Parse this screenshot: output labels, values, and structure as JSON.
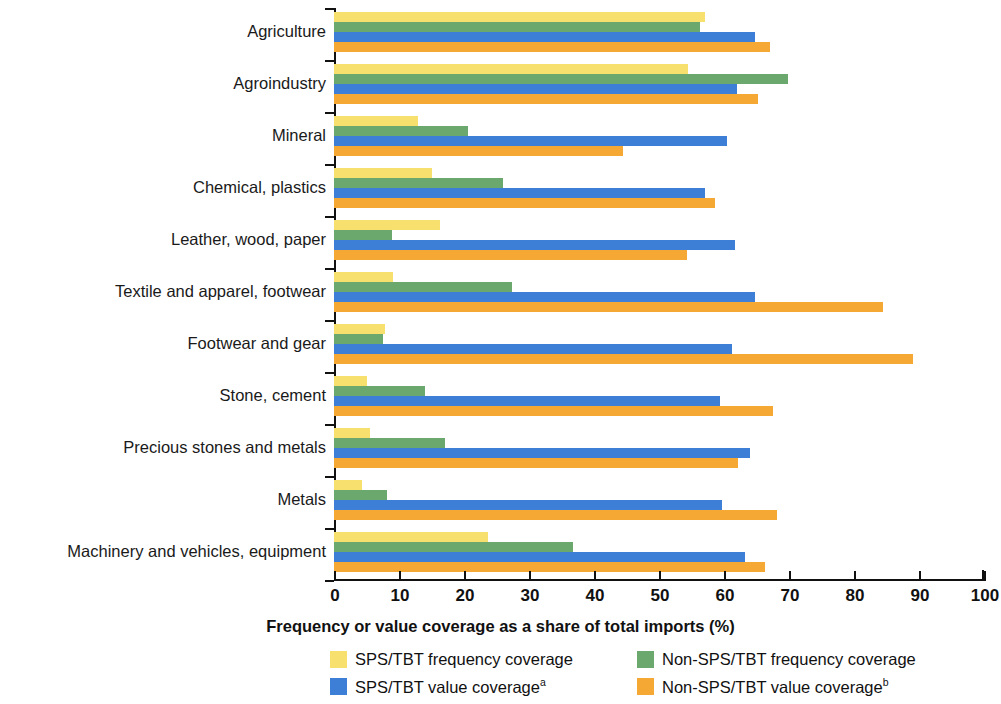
{
  "chart_data": {
    "type": "bar",
    "orientation": "horizontal",
    "title": "",
    "xlabel": "Frequency or value coverage as a share of total imports (%)",
    "ylabel": "",
    "xlim": [
      0,
      100
    ],
    "xticks": [
      0,
      10,
      20,
      30,
      40,
      50,
      60,
      70,
      80,
      90,
      100
    ],
    "grid": false,
    "legend_position": "bottom",
    "categories": [
      "Agriculture",
      "Agroindustry",
      "Mineral",
      "Chemical, plastics",
      "Leather, wood, paper",
      "Textile and apparel, footwear",
      "Footwear and gear",
      "Stone, cement",
      "Precious stones and metals",
      "Metals",
      "Machinery and vehicles, equipment"
    ],
    "series": [
      {
        "name": "SPS/TBT frequency coverage",
        "color": "#f7e06e",
        "values": [
          57.1,
          54.5,
          12.9,
          15.1,
          16.3,
          9.1,
          7.9,
          5.1,
          5.5,
          4.3,
          23.7
        ]
      },
      {
        "name": "Non-SPS/TBT frequency coverage",
        "color": "#6aa86e",
        "values": [
          56.3,
          69.8,
          20.6,
          26.0,
          8.9,
          27.4,
          7.5,
          14.0,
          17.1,
          8.2,
          36.8
        ]
      },
      {
        "name": "SPS/TBT value coverage",
        "color": "#3d7ed6",
        "values": [
          64.8,
          62.0,
          60.5,
          57.1,
          61.7,
          64.8,
          61.2,
          59.4,
          64.0,
          59.7,
          63.2
        ]
      },
      {
        "name": "Non-SPS/TBT value coverage",
        "color": "#f5a833",
        "values": [
          67.1,
          65.2,
          44.5,
          58.6,
          54.3,
          84.5,
          89.1,
          67.5,
          62.2,
          68.2,
          66.3
        ]
      }
    ]
  },
  "legend": {
    "items": [
      {
        "label": "SPS/TBT frequency coverage",
        "sup": "",
        "swatch_class": "sw-y",
        "color": "#f7e06e"
      },
      {
        "label": "Non-SPS/TBT frequency coverage",
        "sup": "",
        "swatch_class": "sw-g",
        "color": "#6aa86e"
      },
      {
        "label": "SPS/TBT value coverage",
        "sup": "a",
        "swatch_class": "sw-b",
        "color": "#3d7ed6"
      },
      {
        "label": "Non-SPS/TBT value coverage",
        "sup": "b",
        "swatch_class": "sw-o",
        "color": "#f5a833"
      }
    ]
  }
}
